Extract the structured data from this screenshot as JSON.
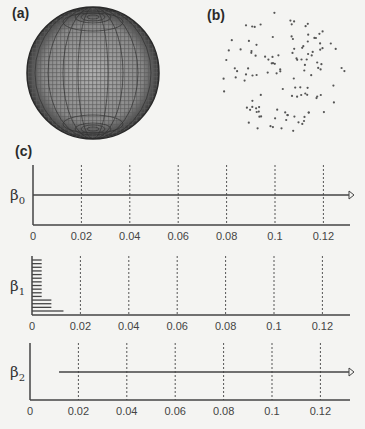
{
  "panels": {
    "a": {
      "label": "(a)",
      "description": "Sphere point cloud (dense sampling)"
    },
    "b": {
      "label": "(b)",
      "description": "Sparse random point sampling of sphere"
    },
    "c": {
      "label": "(c)",
      "description": "Persistence barcodes"
    }
  },
  "chart_data": {
    "type": "barcode",
    "title": "",
    "xlabel": "",
    "xlim": [
      0,
      0.135
    ],
    "xticks": [
      0,
      0.02,
      0.04,
      0.06,
      0.08,
      0.1,
      0.12
    ],
    "xtick_labels": [
      "0",
      "0.02",
      "0.04",
      "0.06",
      "0.08",
      "0.1",
      "0.12"
    ],
    "grid": "vertical dashed at ticks",
    "series": [
      {
        "name": "β0",
        "label_main": "β",
        "label_sub": "0",
        "bars": [
          {
            "start": 0,
            "end": "infinity"
          }
        ]
      },
      {
        "name": "β1",
        "label_main": "β",
        "label_sub": "1",
        "bars": [
          {
            "start": 0,
            "end": 0.004
          },
          {
            "start": 0,
            "end": 0.004
          },
          {
            "start": 0,
            "end": 0.004
          },
          {
            "start": 0,
            "end": 0.004
          },
          {
            "start": 0,
            "end": 0.004
          },
          {
            "start": 0,
            "end": 0.004
          },
          {
            "start": 0,
            "end": 0.004
          },
          {
            "start": 0,
            "end": 0.004
          },
          {
            "start": 0,
            "end": 0.004
          },
          {
            "start": 0,
            "end": 0.004
          },
          {
            "start": 0,
            "end": 0.004
          },
          {
            "start": 0,
            "end": 0.008
          },
          {
            "start": 0,
            "end": 0.008
          },
          {
            "start": 0,
            "end": 0.008
          },
          {
            "start": 0,
            "end": 0.013
          }
        ]
      },
      {
        "name": "β2",
        "label_main": "β",
        "label_sub": "2",
        "bars": [
          {
            "start": 0.012,
            "end": "infinity"
          }
        ]
      }
    ]
  }
}
